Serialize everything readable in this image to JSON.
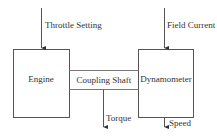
{
  "diagram": {
    "title": "",
    "blocks": [
      {
        "id": "engine",
        "label": "Engine"
      },
      {
        "id": "dynamometer",
        "label": "Dynamometer"
      }
    ],
    "connector": {
      "label": "Coupling Shaft"
    },
    "inputs": [
      {
        "label": "Throttle Setting",
        "target": "engine"
      },
      {
        "label": "Field Current",
        "target": "dynamometer"
      }
    ],
    "outputs": [
      {
        "label": "Torque",
        "source": "coupling-shaft"
      },
      {
        "label": "Speed",
        "source": "dynamometer"
      }
    ],
    "colors": {
      "line": "#555555",
      "text": "#333333",
      "background": "#ffffff"
    }
  }
}
